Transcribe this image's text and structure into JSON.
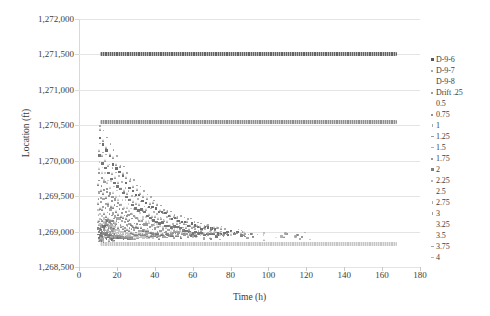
{
  "chart_data": {
    "type": "scatter",
    "title": "",
    "xlabel": "Time (h)",
    "ylabel": "Location (ft)",
    "xlim": [
      0,
      180
    ],
    "ylim": [
      1268500,
      1272000
    ],
    "xticks": [
      0,
      20,
      40,
      60,
      80,
      100,
      120,
      140,
      160,
      180
    ],
    "xtick_labels": [
      "0",
      "20",
      "40",
      "60",
      "80",
      "100",
      "120",
      "140",
      "160",
      "180"
    ],
    "yticks": [
      1268500,
      1269000,
      1269500,
      1270000,
      1270500,
      1271000,
      1271500,
      1272000
    ],
    "ytick_labels": [
      "1,268,500",
      "1,269,000",
      "1,269,500",
      "1,270,000",
      "1,270,500",
      "1,271,000",
      "1,271,500",
      "1,272,000"
    ],
    "grid": true,
    "grid_axis": "y",
    "legend_position": "right",
    "legend_entries": [
      {
        "label": "D-9-6",
        "marker": "square",
        "color": "#595959"
      },
      {
        "label": "D-9-7",
        "marker": "dot",
        "color": "#8c8c8c"
      },
      {
        "label": "D-9-8",
        "marker": "none",
        "color": "#bfbfbf"
      },
      {
        "label": "Drift .25",
        "marker": "dot",
        "color": "#7f7f7f"
      },
      {
        "label": "0.5",
        "marker": "none",
        "color": "#c4c4c4"
      },
      {
        "label": "0.75",
        "marker": "dot",
        "color": "#6e6e6e"
      },
      {
        "label": "1",
        "marker": "tick",
        "color": "#a8a8a8"
      },
      {
        "label": "1.25",
        "marker": "dash",
        "color": "#9a9a9a"
      },
      {
        "label": "1.5",
        "marker": "dash",
        "color": "#b0b0b0"
      },
      {
        "label": "1.75",
        "marker": "dot",
        "color": "#757575"
      },
      {
        "label": "2",
        "marker": "square",
        "color": "#808080"
      },
      {
        "label": "2.25",
        "marker": "dot",
        "color": "#9c9c9c"
      },
      {
        "label": "2.5",
        "marker": "none",
        "color": "#c9c9c9"
      },
      {
        "label": "2.75",
        "marker": "tick",
        "color": "#adadad"
      },
      {
        "label": "3",
        "marker": "tick",
        "color": "#9e9e9e"
      },
      {
        "label": "3.25",
        "marker": "none",
        "color": "#c2c2c2"
      },
      {
        "label": "3.5",
        "marker": "none",
        "color": "#bdbdbd"
      },
      {
        "label": "3.75",
        "marker": "dash",
        "color": "#a6a6a6"
      },
      {
        "label": "4",
        "marker": "dash",
        "color": "#b5b5b5"
      }
    ],
    "series": [
      {
        "name": "D-9-6",
        "note": "steady horizontal band",
        "color": "#636363",
        "y_value": 1271500,
        "x_start": 11,
        "x_end": 168
      },
      {
        "name": "D-9-7",
        "note": "steady horizontal band",
        "color": "#8f8f8f",
        "y_value": 1270540,
        "x_start": 11,
        "x_end": 168
      },
      {
        "name": "D-9-8",
        "note": "steady horizontal band",
        "color": "#c6c6c6",
        "y_value": 1268830,
        "x_start": 11,
        "x_end": 168
      },
      {
        "name": "drift-fan",
        "note": "fan of decaying trajectories converging to lower band",
        "color": "#a0a0a0",
        "x_start": 10,
        "x_end": 80,
        "y_start_max": 1270500,
        "y_end": 1268900
      }
    ]
  }
}
